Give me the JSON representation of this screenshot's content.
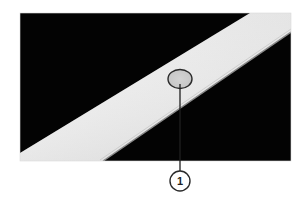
{
  "figure": {
    "type": "annotated-photograph",
    "colors": {
      "background": "#ffffff",
      "photo_dark": "#030303",
      "band_light": "#f2f2f2",
      "band_shadow": "#d6d6d6",
      "edge_line": "#8a8a8a",
      "callout_stroke": "#2a2a2a",
      "spot_fill": "#cfcfcf"
    }
  },
  "callouts": [
    {
      "number": "1"
    }
  ]
}
